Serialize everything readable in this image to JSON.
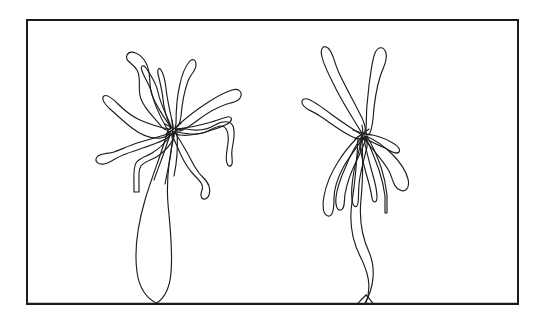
{
  "figure": {
    "title": "Two plant outline drawings",
    "kind": "line-art-illustration",
    "description": "Black ink contour drawing of two rosette plants side by side inside a rectangular frame",
    "background_color": "#ffffff",
    "stroke_color": "#1d1d1d",
    "frame_color": "#1b1b1b",
    "frame_stroke_width_px": 2,
    "line_stroke_width_px": 1.15,
    "canvas_width_px": 545,
    "canvas_height_px": 326,
    "frame": {
      "x": 26,
      "y": 19,
      "width": 493,
      "height": 286
    },
    "baseline": {
      "label": "ground-line",
      "y": 303,
      "x_start": 28,
      "x_end": 517
    },
    "specimens": [
      {
        "id": "specimen-left",
        "label": "left plant",
        "center_x": 172,
        "center_y": 128,
        "leaf_style": "wavy crinkled margins",
        "leaf_count": 11,
        "root_style": "single long tapering taproot reaching the ground line",
        "root_tip_x": 157,
        "root_tip_y": 303
      },
      {
        "id": "specimen-right",
        "label": "right plant",
        "center_x": 362,
        "center_y": 133,
        "leaf_style": "smooth lanceolate blades",
        "leaf_count": 10,
        "root_style": "wavy twin-stranded stem forking at the ground line",
        "root_tip_x": 365,
        "root_tip_y": 303
      }
    ]
  }
}
